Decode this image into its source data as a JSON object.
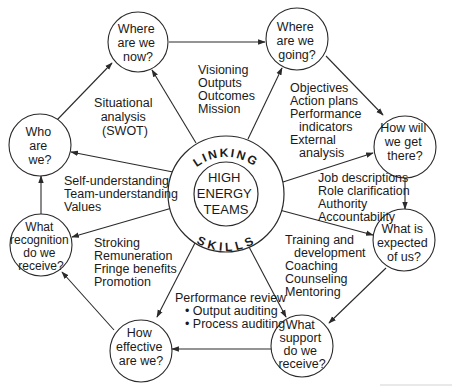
{
  "diagram": {
    "center": {
      "inner_lines": [
        "HIGH",
        "ENERGY",
        "TEAMS"
      ],
      "arc_top": "LINKING",
      "arc_bottom": "SKILLS"
    },
    "nodes": [
      {
        "id": "where-now",
        "lines": [
          "Where",
          "are we",
          "now?"
        ]
      },
      {
        "id": "where-going",
        "lines": [
          "Where",
          "are we",
          "going?"
        ]
      },
      {
        "id": "how-get-there",
        "lines": [
          "How will",
          "we get",
          "there?"
        ]
      },
      {
        "id": "what-expected",
        "lines": [
          "What is",
          "expected",
          "of us?"
        ]
      },
      {
        "id": "what-support",
        "lines": [
          "What",
          "support",
          "do we",
          "receive?"
        ]
      },
      {
        "id": "how-effective",
        "lines": [
          "How",
          "effective",
          "are we?"
        ]
      },
      {
        "id": "what-recognition",
        "lines": [
          "What",
          "recognition",
          "do we",
          "receive?"
        ]
      },
      {
        "id": "who-are-we",
        "lines": [
          "Who",
          "are",
          "we?"
        ]
      }
    ],
    "labels": {
      "situational": [
        "Situational",
        "analysis",
        "(SWOT)"
      ],
      "visioning": [
        "Visioning",
        "Outputs",
        "Outcomes",
        "Mission"
      ],
      "objectives": [
        "Objectives",
        "Action plans",
        "Performance",
        "indicators",
        "External",
        "analysis"
      ],
      "self_understanding": [
        "Self-understanding",
        "Team-understanding",
        "Values"
      ],
      "job_descriptions": [
        "Job descriptions",
        "Role clarification",
        "Authority",
        "Accountability"
      ],
      "stroking": [
        "Stroking",
        "Remuneration",
        "Fringe benefits",
        "Promotion"
      ],
      "training": [
        "Training and",
        "development",
        "Coaching",
        "Counseling",
        "Mentoring"
      ],
      "performance_review": [
        "Performance review",
        "• Output auditing",
        "• Process auditing"
      ]
    },
    "colors": {
      "stroke": "#2a2a2a",
      "text": "#1a1a1a",
      "background": "#ffffff"
    }
  }
}
